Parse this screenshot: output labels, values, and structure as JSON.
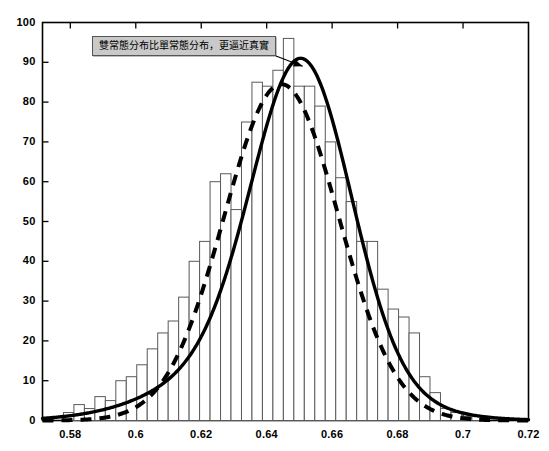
{
  "chart_data": {
    "type": "bar",
    "title": "",
    "subtitle": "",
    "xlabel": "",
    "ylabel": "",
    "xlim": [
      0.5715,
      0.72
    ],
    "ylim": [
      0,
      100
    ],
    "grid": false,
    "legend_position": "none",
    "x_ticks": [
      0.58,
      0.6,
      0.62,
      0.64,
      0.66,
      0.68,
      0.7,
      0.72
    ],
    "x_tick_labels": [
      "0.58",
      "0.6",
      "0.62",
      "0.64",
      "0.66",
      "0.68",
      "0.7",
      "0.72"
    ],
    "y_ticks": [
      0,
      10,
      20,
      30,
      40,
      50,
      60,
      70,
      80,
      90,
      100
    ],
    "y_tick_labels": [
      "0",
      "10",
      "20",
      "30",
      "40",
      "50",
      "60",
      "70",
      "80",
      "90",
      "100"
    ],
    "bin_width": 0.0032,
    "categories": [
      0.5795,
      0.5827,
      0.5859,
      0.5891,
      0.5923,
      0.5955,
      0.5987,
      0.6019,
      0.6051,
      0.6083,
      0.6115,
      0.6147,
      0.6179,
      0.6211,
      0.6243,
      0.6275,
      0.6307,
      0.6339,
      0.6371,
      0.6403,
      0.6435,
      0.6467,
      0.6499,
      0.6531,
      0.6563,
      0.6595,
      0.6627,
      0.6659,
      0.6691,
      0.6723,
      0.6755,
      0.6787,
      0.6819,
      0.6851,
      0.6883,
      0.6915,
      0.6947,
      0.6979,
      0.7011,
      0.7043
    ],
    "values": [
      2,
      4,
      3,
      6,
      5,
      10,
      11,
      14,
      18,
      22,
      25,
      31,
      40,
      45,
      60,
      62,
      53,
      75,
      85,
      84,
      88,
      96,
      84,
      84,
      79,
      70,
      61,
      55,
      45,
      45,
      33,
      28,
      26,
      22,
      11,
      7,
      3,
      2,
      1,
      1
    ],
    "series": [
      {
        "name": "single-normal-fit",
        "style": "dashed",
        "color": "#000000",
        "kind": "line",
        "peak_x": 0.6445,
        "peak_y": 84.5,
        "sigma": 0.0175
      },
      {
        "name": "double-normal-fit",
        "style": "solid",
        "color": "#000000",
        "kind": "line",
        "peak_x": 0.6525,
        "peak_y": 91.0,
        "components": [
          {
            "weight": 0.7,
            "mu": 0.651,
            "sigma": 0.0148
          },
          {
            "weight": 0.3,
            "mu": 0.6415,
            "sigma": 0.0265
          }
        ]
      }
    ],
    "annotations": [
      {
        "name": "fit-comparison-note",
        "text": "雙常態分布比單常態分布，更逼近真實",
        "box_x": 0.5865,
        "box_y": 94.5,
        "arrow_to_x": 0.651,
        "arrow_to_y": 89.0
      }
    ]
  },
  "axes": {
    "frame_color": "#000000",
    "tick_color": "#000000",
    "background": "#ffffff"
  },
  "annotation": {
    "text": "雙常態分布比單常態分布，更逼近真實"
  }
}
